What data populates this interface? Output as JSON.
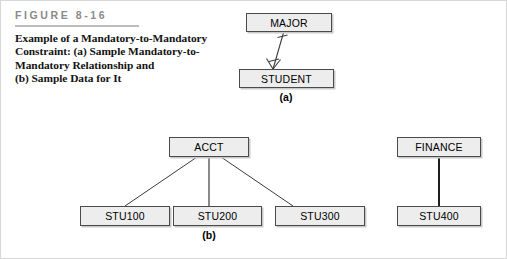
{
  "figure": {
    "label": "FIGURE 8-16",
    "caption_line1": "Example of a Mandatory-to-Mandatory",
    "caption_line2": "Constraint: (a) Sample Mandatory-to-",
    "caption_line3": "Mandatory Relationship and",
    "caption_line4": "(b) Sample Data for It"
  },
  "colors": {
    "box_fill": "#ededed",
    "box_border": "#4a4a4a",
    "box_shadow": "#c9c9c9",
    "label_gray": "#8a8a8a",
    "rule_gray": "#bdbdbd",
    "line": "#3c3c3c",
    "text": "#000000",
    "page_bg": "#ffffff",
    "frame_border": "#d8d8d8"
  },
  "part_a": {
    "part_label": "(a)",
    "parent_entity": "MAJOR",
    "child_entity": "STUDENT",
    "relationship": {
      "parent_cardinality_icon": "mandatory-one-tick",
      "child_cardinality_icon": "mandatory-many-crowsfoot",
      "line_style": "thin-diagonal"
    }
  },
  "part_b": {
    "part_label": "(b)",
    "groups": [
      {
        "parent": "ACCT",
        "children": [
          "STU100",
          "STU200",
          "STU300"
        ],
        "line_style": "thin"
      },
      {
        "parent": "FINANCE",
        "children": [
          "STU400"
        ],
        "line_style": "thick"
      }
    ]
  }
}
